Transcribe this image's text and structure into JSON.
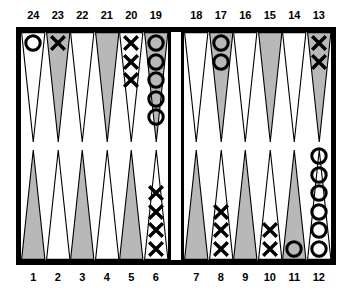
{
  "board": {
    "title": "backgammon-board",
    "colors": {
      "frame": "#000000",
      "background": "#ffffff",
      "point_shaded": "#b8b8b8",
      "point_light": "#ffffff",
      "checker_o": "#000000",
      "checker_x": "#000000"
    },
    "top_labels": [
      "24",
      "23",
      "22",
      "21",
      "20",
      "19",
      "18",
      "17",
      "16",
      "15",
      "14",
      "13"
    ],
    "bottom_labels": [
      "1",
      "2",
      "3",
      "4",
      "5",
      "6",
      "7",
      "8",
      "9",
      "10",
      "11",
      "12"
    ],
    "points": [
      {
        "number": "24",
        "quadrant": "top-left",
        "index": 0,
        "shaded": false,
        "checker": "O",
        "count": 1
      },
      {
        "number": "23",
        "quadrant": "top-left",
        "index": 1,
        "shaded": true,
        "checker": "X",
        "count": 1
      },
      {
        "number": "22",
        "quadrant": "top-left",
        "index": 2,
        "shaded": false,
        "checker": "",
        "count": 0
      },
      {
        "number": "21",
        "quadrant": "top-left",
        "index": 3,
        "shaded": true,
        "checker": "",
        "count": 0
      },
      {
        "number": "20",
        "quadrant": "top-left",
        "index": 4,
        "shaded": false,
        "checker": "X",
        "count": 3
      },
      {
        "number": "19",
        "quadrant": "top-left",
        "index": 5,
        "shaded": true,
        "checker": "O",
        "count": 5
      },
      {
        "number": "18",
        "quadrant": "top-right",
        "index": 0,
        "shaded": false,
        "checker": "",
        "count": 0
      },
      {
        "number": "17",
        "quadrant": "top-right",
        "index": 1,
        "shaded": true,
        "checker": "O",
        "count": 2
      },
      {
        "number": "16",
        "quadrant": "top-right",
        "index": 2,
        "shaded": false,
        "checker": "",
        "count": 0
      },
      {
        "number": "15",
        "quadrant": "top-right",
        "index": 3,
        "shaded": true,
        "checker": "",
        "count": 0
      },
      {
        "number": "14",
        "quadrant": "top-right",
        "index": 4,
        "shaded": false,
        "checker": "",
        "count": 0
      },
      {
        "number": "13",
        "quadrant": "top-right",
        "index": 5,
        "shaded": true,
        "checker": "X",
        "count": 2
      },
      {
        "number": "1",
        "quadrant": "bottom-left",
        "index": 0,
        "shaded": true,
        "checker": "",
        "count": 0
      },
      {
        "number": "2",
        "quadrant": "bottom-left",
        "index": 1,
        "shaded": false,
        "checker": "",
        "count": 0
      },
      {
        "number": "3",
        "quadrant": "bottom-left",
        "index": 2,
        "shaded": true,
        "checker": "",
        "count": 0
      },
      {
        "number": "4",
        "quadrant": "bottom-left",
        "index": 3,
        "shaded": false,
        "checker": "",
        "count": 0
      },
      {
        "number": "5",
        "quadrant": "bottom-left",
        "index": 4,
        "shaded": true,
        "checker": "",
        "count": 0
      },
      {
        "number": "6",
        "quadrant": "bottom-left",
        "index": 5,
        "shaded": false,
        "checker": "X",
        "count": 4
      },
      {
        "number": "7",
        "quadrant": "bottom-right",
        "index": 0,
        "shaded": true,
        "checker": "",
        "count": 0
      },
      {
        "number": "8",
        "quadrant": "bottom-right",
        "index": 1,
        "shaded": false,
        "checker": "X",
        "count": 3
      },
      {
        "number": "9",
        "quadrant": "bottom-right",
        "index": 2,
        "shaded": true,
        "checker": "",
        "count": 0
      },
      {
        "number": "10",
        "quadrant": "bottom-right",
        "index": 3,
        "shaded": false,
        "checker": "X",
        "count": 2
      },
      {
        "number": "11",
        "quadrant": "bottom-right",
        "index": 4,
        "shaded": true,
        "checker": "O",
        "count": 1
      },
      {
        "number": "12",
        "quadrant": "bottom-right",
        "index": 5,
        "shaded": false,
        "checker": "O",
        "count": 6
      }
    ],
    "bar": {
      "label": "bar",
      "o_count": 0,
      "x_count": 0
    }
  }
}
